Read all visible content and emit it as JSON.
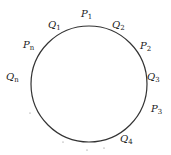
{
  "diagram": {
    "type": "circle-with-labeled-points",
    "circle": {
      "cx": 89,
      "cy": 84,
      "r": 58,
      "stroke": "#333333"
    },
    "labels": [
      {
        "id": "P1",
        "base": "P",
        "sub": "1",
        "x": 81,
        "y": 17
      },
      {
        "id": "Q1",
        "base": "Q",
        "sub": "1",
        "x": 48,
        "y": 28
      },
      {
        "id": "Q2",
        "base": "Q",
        "sub": "2",
        "x": 112,
        "y": 28
      },
      {
        "id": "Pn",
        "base": "P",
        "sub": "n",
        "x": 23,
        "y": 48
      },
      {
        "id": "P2",
        "base": "P",
        "sub": "2",
        "x": 140,
        "y": 49
      },
      {
        "id": "Qn",
        "base": "Q",
        "sub": "n",
        "x": 6,
        "y": 80
      },
      {
        "id": "Q3",
        "base": "Q",
        "sub": "3",
        "x": 147,
        "y": 80
      },
      {
        "id": "P3",
        "base": "P",
        "sub": "3",
        "x": 151,
        "y": 112
      },
      {
        "id": "Q4",
        "base": "Q",
        "sub": "4",
        "x": 120,
        "y": 142
      }
    ]
  }
}
